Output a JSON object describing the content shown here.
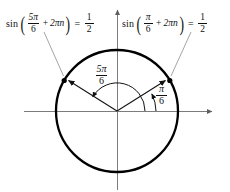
{
  "figure": {
    "kind": "unit-circle-angle-diagram",
    "title_text": "",
    "equations": [
      {
        "id": "left",
        "position": "top-left",
        "function_name": "sin",
        "argument_numerator": "5π",
        "argument_denominator": "6",
        "plus_sign": "+",
        "periodic_term": "2πn",
        "equals_sign": "=",
        "result_numerator": "1",
        "result_denominator": "2",
        "full_text": "sin(5π/6 + 2πn) = 1/2"
      },
      {
        "id": "right",
        "position": "top-right",
        "function_name": "sin",
        "argument_numerator": "π",
        "argument_denominator": "6",
        "plus_sign": "+",
        "periodic_term": "2πn",
        "equals_sign": "=",
        "result_numerator": "1",
        "result_denominator": "2",
        "full_text": "sin(π/6 + 2πn) = 1/2"
      }
    ],
    "angle_labels": [
      {
        "id": "five-pi-over-six",
        "numerator": "5π",
        "denominator": "6",
        "value_degrees": 150,
        "full_text": "5π/6"
      },
      {
        "id": "pi-over-six",
        "numerator": "π",
        "denominator": "6",
        "value_degrees": 30,
        "full_text": "π/6"
      }
    ],
    "circle": {
      "center_x": 117,
      "center_y": 111,
      "radius": 61,
      "stroke_color": "#000000",
      "stroke_width": 2.2
    },
    "axes": {
      "x_axis_color": "#6e6e6e",
      "y_axis_color": "#6e6e6e",
      "x_axis_has_right_arrow": true,
      "y_axis_has_top_arrow": true
    },
    "radii": [
      {
        "id": "radius-150",
        "angle_degrees": 150,
        "has_arrowhead": true,
        "has_endpoint_dot": true
      },
      {
        "id": "radius-30",
        "angle_degrees": 30,
        "has_arrowhead": true,
        "has_endpoint_dot": true
      }
    ],
    "arcs": [
      {
        "id": "arc-5pi6",
        "from_degrees": 0,
        "to_degrees": 150,
        "direction": "counterclockwise",
        "has_arrowhead": true
      },
      {
        "id": "arc-pi6",
        "from_degrees": 0,
        "to_degrees": 30,
        "direction": "counterclockwise",
        "has_arrowhead": true
      }
    ],
    "leader_lines": [
      {
        "id": "leader-left",
        "from": "left-equation",
        "to": "radius-150-endpoint"
      },
      {
        "id": "leader-right",
        "from": "right-equation",
        "to": "radius-30-endpoint"
      }
    ],
    "divider": {
      "id": "equation-divider",
      "orientation": "vertical"
    }
  }
}
